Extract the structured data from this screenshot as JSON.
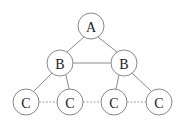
{
  "diagram": {
    "type": "tree",
    "nodes": [
      {
        "id": "a",
        "label": "A",
        "x": 91,
        "y": 26
      },
      {
        "id": "b1",
        "label": "B",
        "x": 60,
        "y": 63
      },
      {
        "id": "b2",
        "label": "B",
        "x": 124,
        "y": 63
      },
      {
        "id": "c1",
        "label": "C",
        "x": 26,
        "y": 102
      },
      {
        "id": "c2",
        "label": "C",
        "x": 70,
        "y": 102
      },
      {
        "id": "c3",
        "label": "C",
        "x": 114,
        "y": 102
      },
      {
        "id": "c4",
        "label": "C",
        "x": 159,
        "y": 102
      }
    ],
    "edges": [
      {
        "from": "a",
        "to": "b1",
        "style": "solid"
      },
      {
        "from": "a",
        "to": "b2",
        "style": "solid"
      },
      {
        "from": "b1",
        "to": "b2",
        "style": "solid"
      },
      {
        "from": "b1",
        "to": "c1",
        "style": "solid"
      },
      {
        "from": "b1",
        "to": "c2",
        "style": "solid"
      },
      {
        "from": "b2",
        "to": "c3",
        "style": "solid"
      },
      {
        "from": "b2",
        "to": "c4",
        "style": "solid"
      },
      {
        "from": "c1",
        "to": "c2",
        "style": "dotted"
      },
      {
        "from": "c2",
        "to": "c3",
        "style": "dotted"
      },
      {
        "from": "c3",
        "to": "c4",
        "style": "dotted"
      }
    ],
    "node_radius": 13,
    "colors": {
      "stroke": "#8a8a8a",
      "text": "#222222",
      "background": "#ffffff"
    }
  }
}
